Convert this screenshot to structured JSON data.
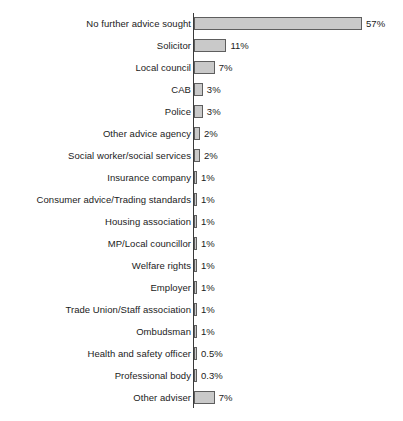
{
  "chart_data": {
    "type": "bar",
    "orientation": "horizontal",
    "title": "",
    "subtitle": "",
    "xlabel": "",
    "ylabel": "",
    "grid": false,
    "legend": null,
    "xlim": [
      0,
      57
    ],
    "value_suffix": "%",
    "categories": [
      "No further advice sought",
      "Solicitor",
      "Local council",
      "CAB",
      "Police",
      "Other advice agency",
      "Social worker/social services",
      "Insurance company",
      "Consumer advice/Trading standards",
      "Housing association",
      "MP/Local councillor",
      "Welfare rights",
      "Employer",
      "Trade Union/Staff association",
      "Ombudsman",
      "Health and safety officer",
      "Professional body",
      "Other adviser"
    ],
    "values": [
      57,
      11,
      7,
      3,
      3,
      2,
      2,
      1,
      1,
      1,
      1,
      1,
      1,
      1,
      1,
      0.5,
      0.3,
      7
    ],
    "value_labels": [
      "57%",
      "11%",
      "7%",
      "3%",
      "3%",
      "2%",
      "2%",
      "1%",
      "1%",
      "1%",
      "1%",
      "1%",
      "1%",
      "1%",
      "1%",
      "0.5%",
      "0.3%",
      "7%"
    ],
    "bars": [
      {
        "label": "No further advice sought",
        "value": 57,
        "value_label": "57%"
      },
      {
        "label": "Solicitor",
        "value": 11,
        "value_label": "11%"
      },
      {
        "label": "Local council",
        "value": 7,
        "value_label": "7%"
      },
      {
        "label": "CAB",
        "value": 3,
        "value_label": "3%"
      },
      {
        "label": "Police",
        "value": 3,
        "value_label": "3%"
      },
      {
        "label": "Other advice agency",
        "value": 2,
        "value_label": "2%"
      },
      {
        "label": "Social worker/social services",
        "value": 2,
        "value_label": "2%"
      },
      {
        "label": "Insurance company",
        "value": 1,
        "value_label": "1%"
      },
      {
        "label": "Consumer advice/Trading standards",
        "value": 1,
        "value_label": "1%"
      },
      {
        "label": "Housing association",
        "value": 1,
        "value_label": "1%"
      },
      {
        "label": "MP/Local councillor",
        "value": 1,
        "value_label": "1%"
      },
      {
        "label": "Welfare rights",
        "value": 1,
        "value_label": "1%"
      },
      {
        "label": "Employer",
        "value": 1,
        "value_label": "1%"
      },
      {
        "label": "Trade Union/Staff association",
        "value": 1,
        "value_label": "1%"
      },
      {
        "label": "Ombudsman",
        "value": 1,
        "value_label": "1%"
      },
      {
        "label": "Health and safety officer",
        "value": 0.5,
        "value_label": "0.5%"
      },
      {
        "label": "Professional body",
        "value": 0.3,
        "value_label": "0.3%"
      },
      {
        "label": "Other adviser",
        "value": 7,
        "value_label": "7%"
      }
    ],
    "colors": {
      "bar_fill": "#c9c9c9",
      "bar_border": "#5e5e5e",
      "axis": "#3a3a3a",
      "text": "#1b1b1b",
      "background": "#ffffff"
    }
  }
}
